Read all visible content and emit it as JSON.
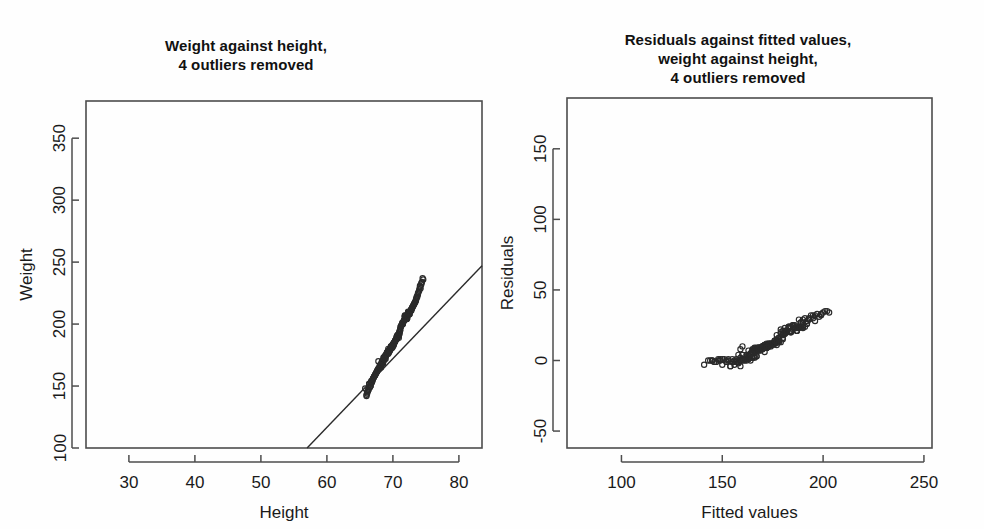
{
  "figure": {
    "background_color": "#fefefe",
    "ink_color": "#2a2a2a",
    "panel_count": 2
  },
  "panels": {
    "left": {
      "title": "Weight against height,\n4 outliers removed",
      "title_line1": "Weight against height,",
      "title_line2": "4 outliers removed"
    },
    "right": {
      "title": "Residuals against fitted values,\nweight against height,\n4 outliers removed",
      "title_line1": "Residuals against fitted values,",
      "title_line2": "weight against height,",
      "title_line3": "4 outliers removed"
    }
  },
  "chart_data": [
    {
      "type": "scatter",
      "panel": "left",
      "title": "Weight against height, 4 outliers removed",
      "xlabel": "Height",
      "ylabel": "Weight",
      "xlim": [
        23.5,
        83.5
      ],
      "ylim": [
        100,
        380
      ],
      "xticks": [
        30,
        40,
        50,
        60,
        70,
        80
      ],
      "yticks": [
        100,
        150,
        200,
        250,
        300,
        350
      ],
      "grid": false,
      "legend": "none",
      "marker": "open-circle",
      "n_points": 248,
      "fit_line": {
        "label": "least-squares regression line",
        "x_start": 57.0,
        "y_start": 100.0,
        "x_end": 83.5,
        "y_end": 247.0,
        "slope": 5.55,
        "intercept": -216.3
      },
      "x": [
        68.2,
        69.5,
        70.1,
        66.4,
        72.3,
        71.0,
        67.8,
        73.1,
        69.9,
        70.6,
        65.8,
        71.7,
        68.9,
        74.0,
        67.2,
        70.3,
        69.1,
        72.8,
        66.9,
        71.2,
        68.5,
        73.5,
        70.8,
        67.6,
        69.3,
        72.0,
        66.1,
        70.0,
        71.5,
        68.0,
        73.8,
        69.7,
        67.0,
        71.9,
        70.4,
        68.7,
        72.5,
        66.6,
        69.0,
        74.3,
        70.9,
        67.4,
        71.3,
        68.3,
        73.2,
        69.6,
        66.3,
        70.7,
        72.1,
        68.8,
        71.6,
        67.9,
        69.4,
        73.6,
        70.2,
        68.1,
        72.7,
        66.8,
        70.5,
        69.8,
        71.1,
        67.3,
        74.6,
        68.6,
        70.0,
        72.4,
        69.2,
        66.0,
        71.8,
        73.0,
        68.4,
        70.1,
        67.7,
        72.9,
        69.9,
        71.4,
        66.5,
        70.6,
        68.2,
        73.4,
        69.5,
        72.2,
        67.1,
        70.9,
        71.0,
        68.9,
        74.1,
        66.7,
        69.8,
        72.6,
        70.3,
        67.5,
        71.7,
        68.0,
        73.3,
        69.1,
        70.8,
        66.2,
        72.0,
        68.5,
        71.2,
        69.6,
        67.8,
        70.4,
        73.7,
        68.3,
        71.9,
        66.9,
        70.0,
        69.3,
        72.3,
        67.2,
        71.5,
        68.7,
        74.4,
        70.7,
        69.0,
        72.8,
        66.4,
        70.2,
        68.1,
        73.1,
        69.7,
        71.3,
        67.6,
        70.5,
        68.8,
        72.5,
        66.1,
        69.4,
        71.8,
        70.1,
        67.0,
        73.9,
        68.4,
        71.0,
        69.9,
        72.1,
        66.6,
        70.6,
        68.2,
        74.2,
        69.5,
        71.6,
        67.4,
        70.3,
        68.9,
        73.5,
        66.3,
        69.2,
        72.7,
        70.8,
        68.0,
        71.1,
        67.9,
        70.0,
        69.6,
        74.0,
        66.8,
        72.4,
        68.6,
        71.4,
        70.4,
        67.3,
        69.8,
        73.2,
        68.3,
        70.9,
        66.0,
        72.9,
        69.1,
        71.7,
        67.7,
        70.2,
        68.7,
        73.6,
        69.9,
        71.2,
        66.5,
        70.5,
        68.1,
        72.2,
        67.5,
        69.4,
        74.5,
        70.7,
        71.9,
        68.8,
        73.3,
        66.9,
        69.0,
        72.0,
        70.1,
        67.1,
        71.5,
        68.5,
        70.6,
        69.7,
        73.8,
        66.2,
        72.6,
        68.2,
        71.0,
        70.3,
        67.8,
        69.3,
        74.1,
        68.9,
        70.8,
        66.7,
        72.3,
        69.6,
        71.3,
        67.0,
        70.0,
        68.4,
        73.0,
        69.8,
        71.8,
        66.4,
        70.4,
        68.6,
        72.8,
        67.6,
        69.1,
        74.3,
        70.9,
        71.1,
        68.0,
        73.4,
        66.6,
        69.5,
        72.5,
        70.2,
        67.2,
        71.6,
        68.7,
        70.7,
        69.9,
        73.7
      ],
      "y": [
        165,
        178,
        183,
        152,
        210,
        192,
        170,
        215,
        181,
        188,
        148,
        203,
        172,
        228,
        158,
        186,
        176,
        212,
        155,
        198,
        168,
        220,
        190,
        162,
        180,
        205,
        145,
        183,
        200,
        166,
        225,
        182,
        156,
        207,
        187,
        171,
        208,
        150,
        175,
        232,
        189,
        160,
        199,
        169,
        216,
        179,
        147,
        191,
        204,
        174,
        202,
        164,
        177,
        221,
        185,
        167,
        211,
        153,
        188,
        182,
        195,
        159,
        236,
        173,
        184,
        209,
        178,
        143,
        206,
        214,
        170,
        183,
        163,
        213,
        181,
        201,
        149,
        190,
        166,
        218,
        179,
        207,
        157,
        192,
        193,
        175,
        230,
        154,
        182,
        210,
        186,
        161,
        203,
        165,
        217,
        177,
        191,
        146,
        205,
        169,
        198,
        180,
        164,
        187,
        223,
        168,
        206,
        155,
        183,
        176,
        209,
        158,
        200,
        172,
        234,
        190,
        175,
        212,
        151,
        185,
        167,
        215,
        182,
        199,
        162,
        188,
        173,
        208,
        144,
        179,
        206,
        184,
        156,
        226,
        170,
        194,
        181,
        204,
        150,
        190,
        166,
        229,
        179,
        202,
        160,
        186,
        174,
        219,
        147,
        177,
        211,
        191,
        165,
        196,
        164,
        183,
        180,
        227,
        153,
        208,
        172,
        200,
        187,
        159,
        182,
        216,
        169,
        192,
        142,
        213,
        177,
        203,
        163,
        185,
        173,
        222,
        182,
        198,
        149,
        188,
        167,
        205,
        161,
        178,
        237,
        191,
        206,
        174,
        217,
        154,
        175,
        204,
        184,
        157,
        201,
        169,
        190,
        181,
        224,
        146,
        210,
        167,
        194,
        186,
        164,
        178,
        231,
        174,
        191,
        152,
        209,
        180,
        199,
        156,
        183,
        170,
        214,
        182,
        207,
        151,
        187,
        173,
        211,
        162,
        177,
        233,
        192,
        195,
        166,
        218,
        150,
        179,
        208,
        185,
        158,
        202,
        172,
        190,
        181,
        222
      ]
    },
    {
      "type": "scatter",
      "panel": "right",
      "title": "Residuals against fitted values, weight against height, 4 outliers removed",
      "xlabel": "Fitted values",
      "ylabel": "Residuals",
      "xlim": [
        73,
        254
      ],
      "ylim": [
        -62,
        186
      ],
      "xticks": [
        100,
        150,
        200,
        250
      ],
      "yticks": [
        -50,
        0,
        50,
        100,
        150
      ],
      "grid": false,
      "legend": "none",
      "marker": "open-circle",
      "n_points": 248,
      "x": [
        162,
        169,
        173,
        152,
        185,
        178,
        160,
        190,
        172,
        176,
        148,
        182,
        166,
        196,
        157,
        174,
        167,
        188,
        159,
        180,
        164,
        192,
        177,
        161,
        170,
        184,
        145,
        172,
        181,
        163,
        195,
        171,
        158,
        183,
        175,
        165,
        187,
        154,
        168,
        199,
        176,
        160,
        179,
        166,
        189,
        170,
        150,
        178,
        184,
        167,
        181,
        163,
        171,
        191,
        173,
        165,
        188,
        156,
        177,
        172,
        180,
        159,
        201,
        164,
        172,
        186,
        169,
        143,
        183,
        190,
        167,
        173,
        162,
        189,
        172,
        180,
        149,
        176,
        162,
        192,
        170,
        185,
        157,
        177,
        178,
        166,
        197,
        155,
        172,
        187,
        174,
        160,
        182,
        163,
        190,
        168,
        178,
        147,
        184,
        164,
        179,
        170,
        160,
        175,
        193,
        166,
        183,
        156,
        172,
        169,
        185,
        158,
        181,
        165,
        200,
        177,
        168,
        188,
        152,
        174,
        165,
        191,
        171,
        180,
        161,
        176,
        166,
        187,
        144,
        170,
        183,
        173,
        157,
        194,
        167,
        178,
        172,
        184,
        154,
        177,
        162,
        198,
        170,
        181,
        159,
        174,
        166,
        190,
        146,
        168,
        186,
        177,
        163,
        180,
        163,
        172,
        170,
        195,
        153,
        187,
        166,
        179,
        175,
        159,
        172,
        189,
        166,
        178,
        141,
        190,
        169,
        182,
        161,
        173,
        166,
        193,
        172,
        180,
        148,
        176,
        160,
        184,
        159,
        170,
        202,
        177,
        183,
        167,
        188,
        153,
        167,
        181,
        174,
        157,
        181,
        164,
        177,
        172,
        196,
        145,
        185,
        159,
        178,
        175,
        160,
        169,
        199,
        166,
        177,
        151,
        186,
        170,
        180,
        155,
        172,
        163,
        190,
        172,
        183,
        150,
        175,
        165,
        187,
        158,
        168,
        203,
        179,
        177,
        163,
        192,
        149,
        170,
        184,
        173,
        156,
        182,
        165,
        176,
        172,
        193
      ],
      "y": [
        3,
        9,
        10,
        0,
        25,
        14,
        10,
        25,
        9,
        12,
        0,
        21,
        6,
        32,
        1,
        12,
        9,
        24,
        -4,
        18,
        4,
        28,
        13,
        1,
        10,
        21,
        0,
        11,
        19,
        3,
        30,
        11,
        -2,
        24,
        12,
        6,
        21,
        -4,
        7,
        33,
        13,
        0,
        20,
        3,
        27,
        9,
        -3,
        13,
        20,
        7,
        21,
        1,
        6,
        30,
        12,
        2,
        23,
        -3,
        11,
        10,
        15,
        0,
        35,
        0,
        12,
        23,
        9,
        0,
        23,
        24,
        3,
        10,
        1,
        24,
        9,
        21,
        0,
        14,
        0,
        26,
        10,
        22,
        -1,
        15,
        15,
        9,
        33,
        -1,
        10,
        23,
        12,
        1,
        21,
        2,
        27,
        9,
        13,
        -1,
        21,
        5,
        19,
        10,
        4,
        12,
        30,
        2,
        23,
        -1,
        11,
        7,
        24,
        -1,
        19,
        7,
        34,
        13,
        7,
        24,
        -1,
        11,
        2,
        24,
        11,
        19,
        1,
        12,
        7,
        21,
        0,
        9,
        23,
        11,
        -1,
        32,
        3,
        16,
        9,
        20,
        -4,
        13,
        4,
        31,
        9,
        21,
        0,
        12,
        8,
        29,
        -1,
        9,
        25,
        14,
        2,
        16,
        1,
        11,
        10,
        32,
        0,
        21,
        6,
        22,
        12,
        0,
        10,
        27,
        3,
        14,
        -3,
        23,
        8,
        21,
        0,
        12,
        7,
        29,
        10,
        18,
        1,
        12,
        1,
        21,
        2,
        8,
        35,
        14,
        23,
        7,
        29,
        1,
        8,
        23,
        10,
        0,
        20,
        5,
        13,
        9,
        28,
        0,
        25,
        8,
        16,
        11,
        4,
        9,
        32,
        8,
        13,
        1,
        23,
        10,
        19,
        1,
        11,
        7,
        24,
        10,
        24,
        1,
        12,
        8,
        24,
        4,
        9,
        34,
        13,
        18,
        3,
        26,
        1,
        9,
        24,
        11,
        0,
        20,
        7,
        14,
        9,
        29
      ]
    }
  ]
}
